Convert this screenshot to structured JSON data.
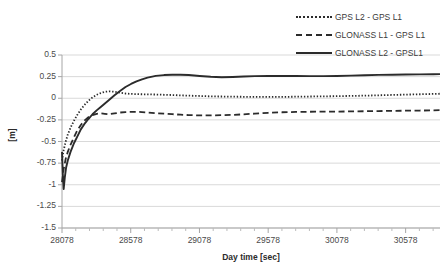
{
  "chart_data": {
    "type": "line",
    "title": "",
    "xlabel": "Day time [sec]",
    "ylabel": "[m]",
    "xlim": [
      28078,
      30828
    ],
    "ylim": [
      -1.5,
      0.5
    ],
    "xticks": [
      28078,
      28578,
      29078,
      29578,
      30078,
      30578
    ],
    "xtick_labels": [
      "28078",
      "28578",
      "29078",
      "29578",
      "30078",
      "30578"
    ],
    "yticks": [
      0.5,
      0.25,
      0,
      -0.25,
      -0.5,
      -0.75,
      -1,
      -1.25,
      -1.5
    ],
    "ytick_labels": [
      "0.5",
      "0.25",
      "0",
      "-0.25",
      "-0.5",
      "-0.75",
      "-1",
      "-1.25",
      "-1.5"
    ],
    "grid": true,
    "grid_axis": "y",
    "legend_position": "top-right",
    "series": [
      {
        "name": "GPS L2 - GPS L1",
        "style": "dotted",
        "color": "#2b2b2b",
        "x": [
          28078,
          28090,
          28105,
          28120,
          28140,
          28165,
          28190,
          28215,
          28240,
          28270,
          28300,
          28330,
          28360,
          28390,
          28420,
          28460,
          28500,
          28540,
          28580,
          28620,
          28660,
          28700,
          28760,
          28820,
          28880,
          28940,
          29000,
          29080,
          29160,
          29240,
          29320,
          29400,
          29480,
          29578,
          29680,
          29780,
          29880,
          29980,
          30078,
          30180,
          30280,
          30380,
          30480,
          30578,
          30680,
          30780,
          30828
        ],
        "y": [
          -0.72,
          -0.6,
          -0.5,
          -0.42,
          -0.34,
          -0.26,
          -0.19,
          -0.13,
          -0.08,
          -0.03,
          0.01,
          0.04,
          0.06,
          0.075,
          0.08,
          0.075,
          0.065,
          0.055,
          0.05,
          0.048,
          0.046,
          0.045,
          0.043,
          0.04,
          0.037,
          0.033,
          0.03,
          0.026,
          0.022,
          0.02,
          0.018,
          0.017,
          0.016,
          0.015,
          0.016,
          0.018,
          0.02,
          0.022,
          0.024,
          0.027,
          0.03,
          0.034,
          0.038,
          0.042,
          0.046,
          0.05,
          0.052
        ]
      },
      {
        "name": "GLONASS L1 - GPS L1",
        "style": "dashed",
        "color": "#2b2b2b",
        "x": [
          28078,
          28090,
          28105,
          28120,
          28140,
          28165,
          28190,
          28215,
          28240,
          28270,
          28300,
          28330,
          28360,
          28390,
          28420,
          28460,
          28500,
          28540,
          28580,
          28620,
          28660,
          28700,
          28760,
          28820,
          28880,
          28940,
          29000,
          29080,
          29160,
          29240,
          29320,
          29400,
          29480,
          29578,
          29680,
          29780,
          29880,
          29980,
          30078,
          30180,
          30280,
          30380,
          30480,
          30578,
          30680,
          30780,
          30828
        ],
        "y": [
          -0.97,
          -0.82,
          -0.7,
          -0.62,
          -0.54,
          -0.45,
          -0.37,
          -0.31,
          -0.26,
          -0.22,
          -0.195,
          -0.18,
          -0.175,
          -0.18,
          -0.185,
          -0.175,
          -0.165,
          -0.16,
          -0.158,
          -0.157,
          -0.16,
          -0.165,
          -0.172,
          -0.178,
          -0.184,
          -0.19,
          -0.195,
          -0.198,
          -0.198,
          -0.196,
          -0.192,
          -0.186,
          -0.178,
          -0.168,
          -0.162,
          -0.158,
          -0.156,
          -0.155,
          -0.154,
          -0.152,
          -0.15,
          -0.148,
          -0.146,
          -0.144,
          -0.142,
          -0.14,
          -0.138
        ]
      },
      {
        "name": "GLONASS L2 - GPSL1",
        "style": "solid",
        "color": "#2b2b2b",
        "x": [
          28078,
          28084,
          28090,
          28098,
          28108,
          28120,
          28140,
          28165,
          28190,
          28215,
          28240,
          28270,
          28300,
          28330,
          28360,
          28390,
          28420,
          28460,
          28500,
          28540,
          28580,
          28620,
          28660,
          28700,
          28760,
          28820,
          28880,
          28940,
          29000,
          29080,
          29160,
          29240,
          29320,
          29400,
          29480,
          29578,
          29680,
          29780,
          29880,
          29980,
          30078,
          30180,
          30280,
          30380,
          30480,
          30578,
          30680,
          30780,
          30828
        ],
        "y": [
          -0.62,
          -0.88,
          -1.05,
          -0.92,
          -0.8,
          -0.72,
          -0.62,
          -0.52,
          -0.44,
          -0.36,
          -0.3,
          -0.24,
          -0.185,
          -0.14,
          -0.1,
          -0.06,
          -0.02,
          0.035,
          0.085,
          0.13,
          0.165,
          0.195,
          0.218,
          0.238,
          0.258,
          0.268,
          0.272,
          0.272,
          0.268,
          0.258,
          0.248,
          0.242,
          0.246,
          0.252,
          0.256,
          0.258,
          0.258,
          0.257,
          0.256,
          0.256,
          0.258,
          0.262,
          0.266,
          0.27,
          0.272,
          0.274,
          0.276,
          0.278,
          0.279
        ]
      }
    ]
  },
  "legend": {
    "items": [
      {
        "label": "GPS L2 - GPS L1",
        "style": "dotted"
      },
      {
        "label": "GLONASS L1 - GPS L1",
        "style": "dashed"
      },
      {
        "label": "GLONASS L2 - GPSL1",
        "style": "solid"
      }
    ]
  }
}
